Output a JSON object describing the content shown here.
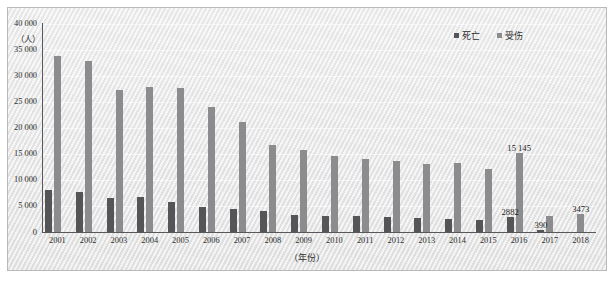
{
  "chart_data": {
    "type": "bar",
    "title": "",
    "xlabel": "（年份）",
    "ylabel": "（人）",
    "ylim": [
      0,
      40000
    ],
    "ytick_labels": [
      "40 000",
      "35 000",
      "30 000",
      "25 000",
      "20 000",
      "15 000",
      "10 000",
      "5 000",
      "0"
    ],
    "ytick_values": [
      40000,
      35000,
      30000,
      25000,
      20000,
      15000,
      10000,
      5000,
      0
    ],
    "grid": true,
    "legend_position": "top-right",
    "categories": [
      "2001",
      "2002",
      "2003",
      "2004",
      "2005",
      "2006",
      "2007",
      "2008",
      "2009",
      "2010",
      "2011",
      "2012",
      "2013",
      "2014",
      "2015",
      "2016",
      "2017",
      "2018"
    ],
    "series": [
      {
        "name": "死亡",
        "color": "#555558",
        "values": [
          8090,
          7720,
          6480,
          6680,
          5780,
          4850,
          4450,
          4010,
          3230,
          3000,
          3100,
          2800,
          2650,
          2550,
          2300,
          2882,
          390,
          0
        ]
      },
      {
        "name": "受伤",
        "color": "#8c8c8e",
        "values": [
          33600,
          32800,
          27100,
          27700,
          27600,
          23900,
          21000,
          16700,
          15700,
          14500,
          13900,
          13500,
          13000,
          13200,
          12000,
          15145,
          3000,
          3473
        ]
      }
    ],
    "point_labels": [
      {
        "text": "2882",
        "series": "死亡",
        "category": "2016"
      },
      {
        "text": "15 145",
        "series": "受伤",
        "category": "2016"
      },
      {
        "text": "390",
        "series": "死亡",
        "category": "2017"
      },
      {
        "text": "3473",
        "series": "受伤",
        "category": "2018"
      }
    ]
  },
  "legend": {
    "items": [
      {
        "label": "死亡",
        "color": "#555558"
      },
      {
        "label": "受伤",
        "color": "#8c8c8e"
      }
    ]
  }
}
